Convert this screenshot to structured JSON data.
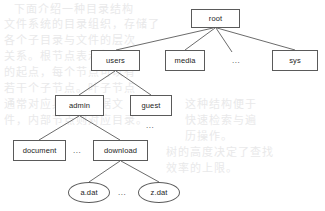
{
  "diagram": {
    "type": "tree",
    "stroke_color": "#5a5a5a",
    "text_color": "#1c1c1c",
    "background_color": "#ffffff",
    "ellipsis": "...",
    "nodes": [
      {
        "id": "root",
        "label": "root",
        "shape": "rect",
        "x": 191,
        "y": 9,
        "w": 49,
        "h": 19
      },
      {
        "id": "users",
        "label": "users",
        "shape": "rect",
        "x": 91,
        "y": 50,
        "w": 49,
        "h": 21
      },
      {
        "id": "media",
        "label": "media",
        "shape": "rect",
        "x": 165,
        "y": 50,
        "w": 40,
        "h": 21
      },
      {
        "id": "sys",
        "label": "sys",
        "shape": "rect",
        "x": 272,
        "y": 50,
        "w": 46,
        "h": 21
      },
      {
        "id": "admin",
        "label": "admin",
        "shape": "rect",
        "x": 55,
        "y": 95,
        "w": 49,
        "h": 21
      },
      {
        "id": "guest",
        "label": "guest",
        "shape": "rect",
        "x": 130,
        "y": 95,
        "w": 42,
        "h": 21
      },
      {
        "id": "document",
        "label": "document",
        "shape": "rect",
        "x": 13,
        "y": 140,
        "w": 53,
        "h": 21
      },
      {
        "id": "download",
        "label": "download",
        "shape": "rect",
        "x": 93,
        "y": 140,
        "w": 55,
        "h": 21
      },
      {
        "id": "adat",
        "label": "a.dat",
        "shape": "ellipse",
        "x": 68,
        "y": 182,
        "w": 42,
        "h": 21
      },
      {
        "id": "zdat",
        "label": "z.dat",
        "shape": "ellipse",
        "x": 138,
        "y": 182,
        "w": 42,
        "h": 21
      }
    ],
    "ellipses_markers": [
      {
        "id": "dots-root-row",
        "label": "...",
        "x": 232,
        "y": 57
      },
      {
        "id": "dots-guest-child",
        "label": "...",
        "x": 146,
        "y": 122
      },
      {
        "id": "dots-admin-child",
        "label": "...",
        "x": 73,
        "y": 147
      },
      {
        "id": "dots-download-child",
        "label": "...",
        "x": 118,
        "y": 189
      }
    ],
    "edges": [
      {
        "from": "root",
        "to": "users",
        "x1": 213,
        "y1": 28,
        "x2": 116,
        "y2": 50
      },
      {
        "from": "root",
        "to": "media",
        "x1": 215,
        "y1": 28,
        "x2": 185,
        "y2": 50
      },
      {
        "from": "root",
        "to": "dots",
        "x1": 216,
        "y1": 28,
        "x2": 232,
        "y2": 52
      },
      {
        "from": "root",
        "to": "sys",
        "x1": 217,
        "y1": 28,
        "x2": 295,
        "y2": 50
      },
      {
        "from": "users",
        "to": "admin",
        "x1": 115,
        "y1": 71,
        "x2": 79,
        "y2": 95
      },
      {
        "from": "users",
        "to": "guest",
        "x1": 116,
        "y1": 71,
        "x2": 151,
        "y2": 95
      },
      {
        "from": "admin",
        "to": "document",
        "x1": 79,
        "y1": 116,
        "x2": 39,
        "y2": 140
      },
      {
        "from": "admin",
        "to": "download",
        "x1": 80,
        "y1": 116,
        "x2": 120,
        "y2": 140
      },
      {
        "from": "download",
        "to": "adat",
        "x1": 120,
        "y1": 161,
        "x2": 89,
        "y2": 182
      },
      {
        "from": "download",
        "to": "zdat",
        "x1": 121,
        "y1": 161,
        "x2": 159,
        "y2": 182
      }
    ]
  },
  "background_bleed": {
    "note": "faint scanned show-through text from reverse page",
    "lines": [
      {
        "x": 14,
        "y": 2,
        "text": "下面介绍一种目录结构"
      },
      {
        "x": 4,
        "y": 17,
        "text": "文件系统的目录组织，存储了"
      },
      {
        "x": 4,
        "y": 33,
        "text": "各个子目录与文件的层次"
      },
      {
        "x": 4,
        "y": 49,
        "text": "关系。根节点表示整个树"
      },
      {
        "x": 4,
        "y": 65,
        "text": "的起点，每个节点可以有"
      },
      {
        "x": 4,
        "y": 81,
        "text": "若干个子节点。叶子节点"
      },
      {
        "x": 4,
        "y": 97,
        "text": "通常对应具体的数据文"
      },
      {
        "x": 4,
        "y": 113,
        "text": "件，内部节点则对应目录。"
      },
      {
        "x": 185,
        "y": 97,
        "text": "这种结构便于"
      },
      {
        "x": 185,
        "y": 113,
        "text": "快速检索与遍"
      },
      {
        "x": 185,
        "y": 129,
        "text": "历操作。"
      },
      {
        "x": 166,
        "y": 145,
        "text": "树的高度决定了查找"
      },
      {
        "x": 166,
        "y": 161,
        "text": "效率的上限。"
      }
    ]
  }
}
